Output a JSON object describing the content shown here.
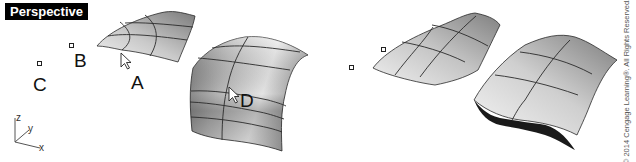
{
  "viewport": {
    "title": "Perspective"
  },
  "labels": {
    "point_a": "A",
    "point_b": "B",
    "point_c": "C",
    "point_d": "D"
  },
  "axes": {
    "x": "x",
    "y": "y",
    "z": "z"
  },
  "icons": {
    "cursor_a": "arrow-cursor",
    "cursor_d": "arrow-cursor"
  },
  "colors": {
    "label_bg": "#000000",
    "label_text": "#ffffff",
    "surface_light": "#e6e6e6",
    "surface_dark": "#6e6e6e",
    "isocurve": "#2a2a2a",
    "shadow": "#1a1a1a"
  },
  "copyright": "© 2014 Cengage Learning®. All Rights Reserved."
}
